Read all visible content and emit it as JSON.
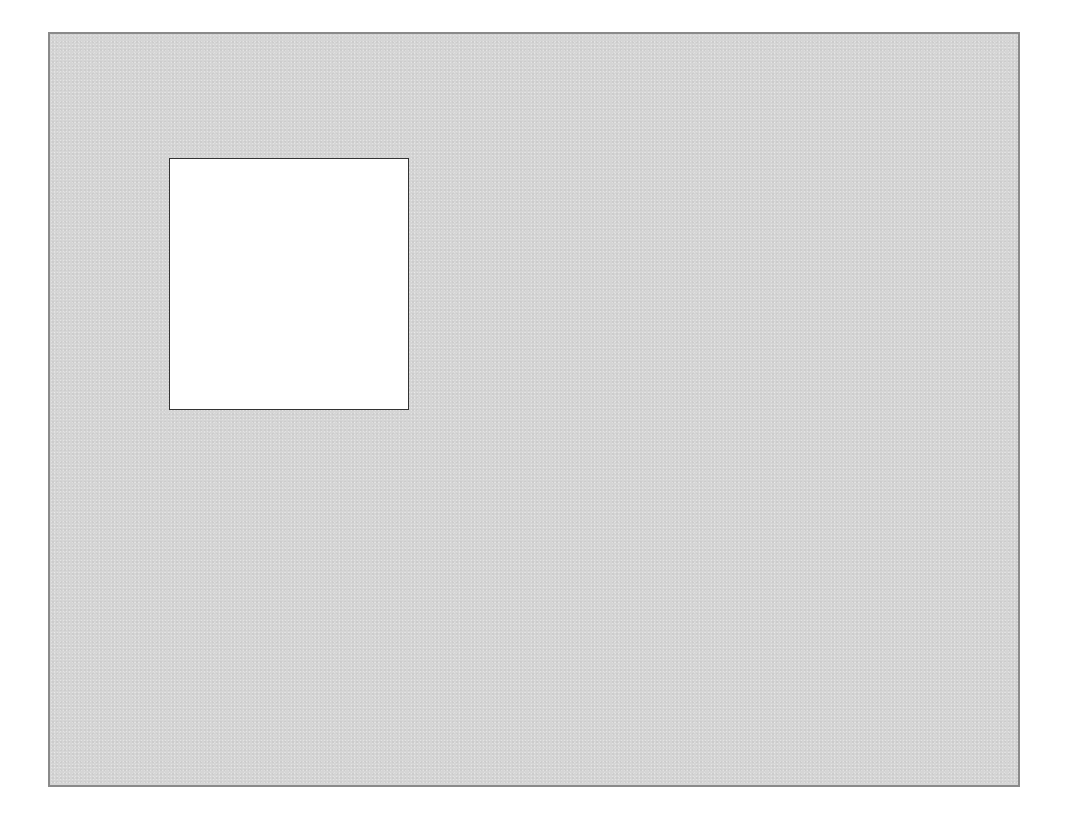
{
  "canvas": {
    "background_color": "#d5d5d5",
    "border_color": "#8a8a8a"
  },
  "panel": {
    "background_color": "#ffffff",
    "border_color": "#333333",
    "content": ""
  }
}
